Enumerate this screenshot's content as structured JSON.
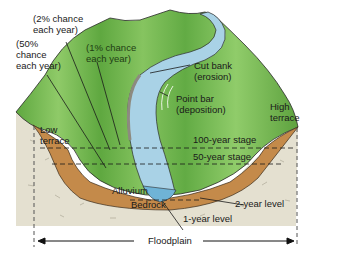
{
  "header": {
    "cutoff_text": ""
  },
  "labels": {
    "two_percent": "(2% chance\neach year)",
    "fifty_percent": "(50%\nchance\neach year)",
    "one_percent": "(1% chance\neach year)",
    "cut_bank": "Cut bank\n(erosion)",
    "point_bar": "Point bar\n(deposition)",
    "high_terrace": "High\nterrace",
    "low_terrace": "Low\nterrace",
    "hundred_year_stage": "100-year stage",
    "fifty_year_stage": "50-year stage",
    "alluvium": "Alluvium",
    "bedrock": "Bedrock",
    "two_year_level": "2-year level",
    "one_year_level": "1-year level",
    "floodplain": "Floodplain"
  },
  "colors": {
    "vegetation_green": "#6cb04a",
    "vegetation_light": "#9fd07a",
    "river_blue": "#a9d2e6",
    "river_deep": "#6fb3d6",
    "alluvium_brown": "#c48a4a",
    "bedrock_tan": "#e3dfcf",
    "outline": "#2a2a2a"
  }
}
